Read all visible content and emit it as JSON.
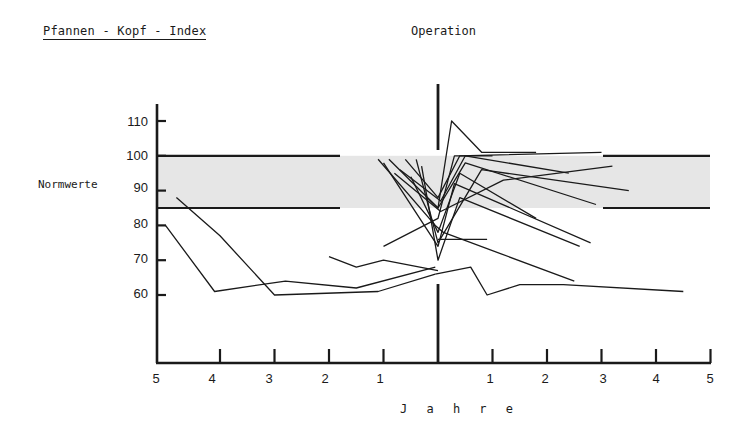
{
  "title": "Pfannen - Kopf - Index",
  "operation_label": "Operation",
  "normwerte_label": "Normwerte",
  "xlabel": "J a h r e",
  "colors": {
    "ink": "#1a1a1a",
    "band": "#e6e6e6"
  },
  "y_ticks": [
    "110",
    "100",
    "90",
    "80",
    "70",
    "60"
  ],
  "x_ticks": [
    "5",
    "4",
    "3",
    "2",
    "1",
    "1",
    "2",
    "3",
    "4",
    "5"
  ],
  "chart_data": {
    "type": "line",
    "title": "Pfannen - Kopf - Index",
    "xlabel": "Jahre",
    "ylabel": "",
    "annotations": [
      "Operation",
      "Normwerte"
    ],
    "x_axis": {
      "range": [
        -5,
        5
      ],
      "ticks_before_operation": [
        5,
        4,
        3,
        2,
        1
      ],
      "ticks_after_operation": [
        1,
        2,
        3,
        4,
        5
      ],
      "operation_at": 0
    },
    "y_axis": {
      "range": [
        50,
        115
      ],
      "ticks": [
        60,
        70,
        80,
        90,
        100,
        110
      ]
    },
    "normal_band": {
      "low": 85,
      "high": 100,
      "label": "Normwerte"
    },
    "grid": false,
    "legend": null,
    "series": [
      {
        "name": "case-a",
        "x": [
          -5,
          -4.1,
          -2.8,
          -1.5,
          -0.05
        ],
        "y": [
          80,
          61,
          64,
          62,
          68
        ]
      },
      {
        "name": "case-b",
        "x": [
          -4.8,
          -4.0,
          -3.0,
          -1.1,
          -0.05
        ],
        "y": [
          88,
          77,
          60,
          61,
          66
        ]
      },
      {
        "name": "case-c",
        "x": [
          -0.05,
          0.6,
          0.9,
          1.5,
          2.3,
          4.5
        ],
        "y": [
          66,
          68,
          60,
          63,
          63,
          61
        ]
      },
      {
        "name": "case-d",
        "x": [
          -2.0,
          -1.5,
          -1.0,
          0.0
        ],
        "y": [
          71,
          68,
          70,
          67
        ]
      },
      {
        "name": "case-e",
        "x": [
          -1.1,
          -0.05,
          0.1,
          2.5
        ],
        "y": [
          99,
          80,
          78,
          64
        ]
      },
      {
        "name": "case-f",
        "x": [
          -0.9,
          0.0,
          0.25,
          0.8,
          1.8
        ],
        "y": [
          99,
          85,
          110,
          101,
          101
        ]
      },
      {
        "name": "case-g",
        "x": [
          -0.6,
          0.0,
          0.4,
          3.0
        ],
        "y": [
          99,
          88,
          100,
          101
        ]
      },
      {
        "name": "case-h",
        "x": [
          -1.0,
          0.0,
          0.3,
          2.8
        ],
        "y": [
          98,
          74,
          92,
          75
        ]
      },
      {
        "name": "case-i",
        "x": [
          -0.3,
          0.0,
          0.4,
          2.6
        ],
        "y": [
          97,
          70,
          88,
          74
        ]
      },
      {
        "name": "case-j",
        "x": [
          -0.5,
          0.0,
          0.4,
          1.8
        ],
        "y": [
          94,
          78,
          95,
          82
        ]
      },
      {
        "name": "case-k",
        "x": [
          -0.7,
          0.05,
          0.5,
          2.4
        ],
        "y": [
          96,
          87,
          100,
          95
        ]
      },
      {
        "name": "case-l",
        "x": [
          -0.4,
          0.0,
          0.8,
          3.5
        ],
        "y": [
          99,
          75,
          96,
          90
        ]
      },
      {
        "name": "case-m",
        "x": [
          -0.8,
          0.05,
          1.2,
          3.2
        ],
        "y": [
          95,
          84,
          93,
          97
        ]
      },
      {
        "name": "case-n",
        "x": [
          -1.0,
          0.0,
          0.3,
          1.0
        ],
        "y": [
          74,
          82,
          100,
          100
        ]
      },
      {
        "name": "case-o",
        "x": [
          -0.2,
          0.0,
          0.5,
          2.9
        ],
        "y": [
          88,
          85,
          98,
          86
        ]
      },
      {
        "name": "case-p",
        "x": [
          0.0,
          0.9
        ],
        "y": [
          76,
          76
        ]
      }
    ]
  }
}
